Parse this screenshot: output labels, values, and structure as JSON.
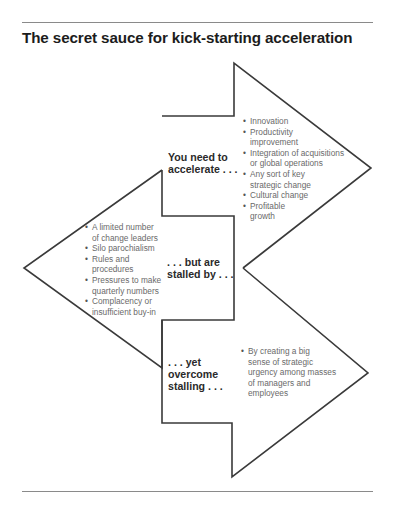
{
  "title": "The secret sauce for kick-starting acceleration",
  "sections": [
    {
      "label": "You need to\naccelerate . . .",
      "bullets": [
        "Innovation",
        "Productivity\nimprovement",
        "Integration of acquisitions\nor global operations",
        "Any sort of key\nstrategic change",
        "Cultural change",
        "Profitable\ngrowth"
      ]
    },
    {
      "label": ". . . but are\nstalled by . . .",
      "bullets": [
        "A limited number\nof change leaders",
        "Silo parochialism",
        "Rules and\nprocedures",
        "Pressures to make\nquarterly numbers",
        "Complacency or\ninsufficient buy-in"
      ]
    },
    {
      "label": ". . . yet\novercome\nstalling . . .",
      "bullets": [
        "By creating a big\nsense of strategic\nurgency among masses\nof managers and\nemployees"
      ]
    }
  ],
  "colors": {
    "stroke": "#3a3a3a",
    "label_text": "#2a2a2a",
    "bullet_text": "#6a6a6a",
    "rule": "#8a8a8a"
  }
}
